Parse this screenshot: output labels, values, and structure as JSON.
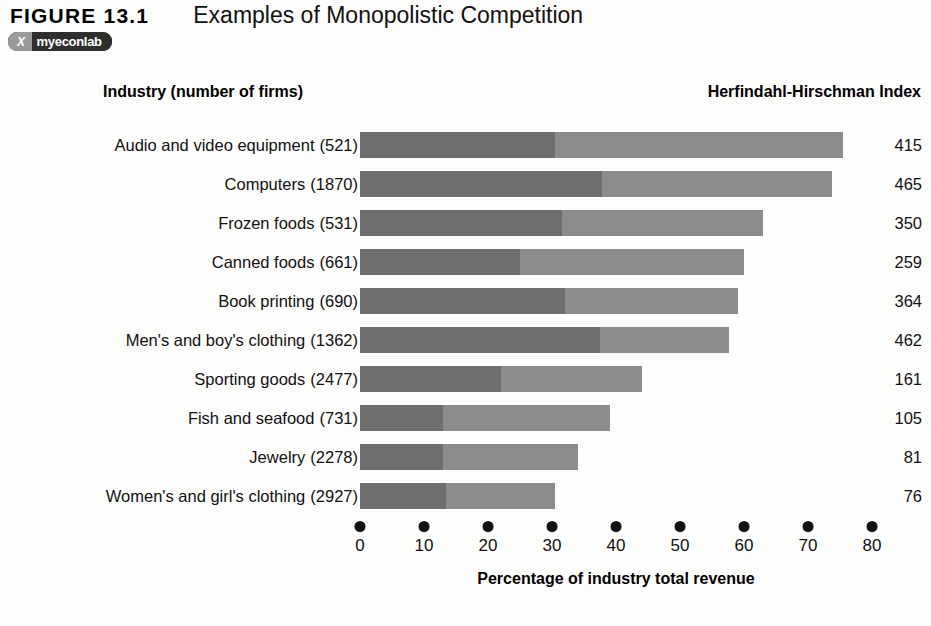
{
  "figure": {
    "number": "FIGURE 13.1",
    "title": "Examples of Monopolistic Competition"
  },
  "badge": {
    "logo_text": "X",
    "label": "myeconlab"
  },
  "headers": {
    "left_column": "Industry (number of firms)",
    "right_column": "Herfindahl-Hirschman Index"
  },
  "colors": {
    "segment_dark": "#6e6e6e",
    "segment_light": "#8c8c8c",
    "text": "#111111",
    "background": "#fdfdfc"
  },
  "chart_data": {
    "type": "bar",
    "orientation": "horizontal",
    "stacked": true,
    "title": "Examples of Monopolistic Competition",
    "xlabel": "Percentage of industry total revenue",
    "ylabel": "Industry (number of firms)",
    "xlim": [
      0,
      80
    ],
    "xticks": [
      0,
      10,
      20,
      30,
      40,
      50,
      60,
      70,
      80
    ],
    "xtick_labels": [
      "0",
      "10",
      "20",
      "30",
      "40",
      "50",
      "60",
      "70",
      "80"
    ],
    "grid": false,
    "legend": null,
    "categories": [
      "Audio and video equipment",
      "Computers",
      "Frozen foods",
      "Canned foods",
      "Book printing",
      "Men's and boy's clothing",
      "Sporting goods",
      "Fish and seafood",
      "Jewelry",
      "Women's and girl's clothing"
    ],
    "firms": [
      521,
      1870,
      531,
      661,
      690,
      1362,
      2477,
      731,
      2278,
      2927
    ],
    "firms_labels": [
      "(521)",
      "(1870)",
      "(531)",
      "(661)",
      "(690)",
      "(1362)",
      "(2477)",
      "(731)",
      "(2278)",
      "(2927)"
    ],
    "series": [
      {
        "name": "Four-firm concentration ratio",
        "color": "#6e6e6e",
        "values": [
          30.5,
          37.8,
          31.5,
          25.0,
          32.0,
          37.5,
          22.0,
          13.0,
          13.0,
          13.5
        ]
      },
      {
        "name": "Remaining share of industry revenue",
        "color": "#8c8c8c",
        "values": [
          45.0,
          35.9,
          31.5,
          35.0,
          27.0,
          20.2,
          22.0,
          26.0,
          21.0,
          17.0
        ]
      }
    ],
    "totals": [
      75.5,
      73.7,
      63.0,
      60.0,
      59.0,
      57.7,
      44.0,
      39.0,
      34.0,
      30.5
    ],
    "hhi_values": [
      415,
      465,
      350,
      259,
      364,
      462,
      161,
      105,
      81,
      76
    ],
    "hhi_labels": [
      "415",
      "465",
      "350",
      "259",
      "364",
      "462",
      "161",
      "105",
      "81",
      "76"
    ]
  }
}
